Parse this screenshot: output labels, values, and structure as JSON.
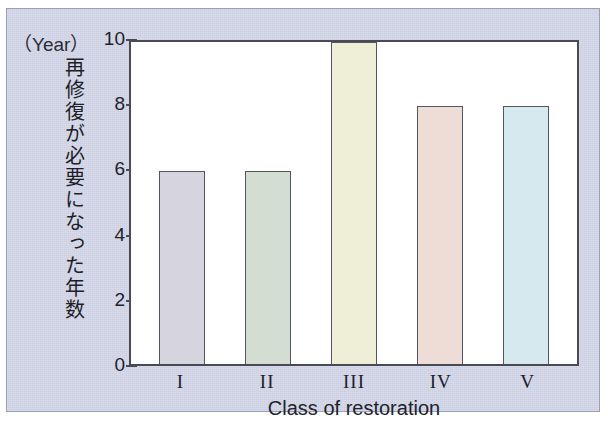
{
  "figure": {
    "unit_caption": "（Year）",
    "background_color": "#ccd0e2",
    "plot_background_color": "#ffffff",
    "axis_color": "#4a4a55"
  },
  "chart_data": {
    "type": "bar",
    "title": "",
    "subtitle": "",
    "xlabel": "Class of restoration",
    "ylabel": "再修復が必要になった年数",
    "yunit": "（Year）",
    "categories": [
      "I",
      "II",
      "III",
      "IV",
      "V"
    ],
    "values": [
      6,
      6,
      10,
      8,
      8
    ],
    "ylim": [
      0,
      10
    ],
    "yticks": [
      0,
      2,
      4,
      6,
      8,
      10
    ],
    "ytick_labels": [
      "0",
      "2",
      "4",
      "6",
      "8",
      "10"
    ],
    "grid": false,
    "legend": false,
    "bar_colors": [
      "#d5d4df",
      "#d3ddd1",
      "#efeed7",
      "#eeddd6",
      "#d5e9ef"
    ],
    "bar_edge_color": "#55555f",
    "series": [
      {
        "name": "再修復が必要になった年数",
        "values": [
          6,
          6,
          10,
          8,
          8
        ]
      }
    ],
    "points": [
      {
        "category": "I",
        "value": 6,
        "color": "#d5d4df"
      },
      {
        "category": "II",
        "value": 6,
        "color": "#d3ddd1"
      },
      {
        "category": "III",
        "value": 10,
        "color": "#efeed7"
      },
      {
        "category": "IV",
        "value": 8,
        "color": "#eeddd6"
      },
      {
        "category": "V",
        "value": 8,
        "color": "#d5e9ef"
      }
    ]
  }
}
